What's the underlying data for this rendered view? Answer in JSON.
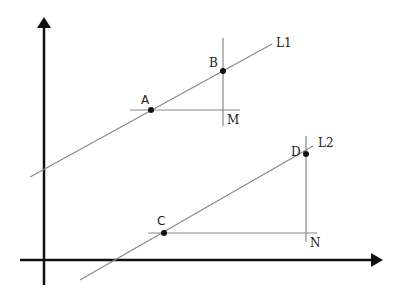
{
  "diagram": {
    "axes": {
      "x_axis": {
        "x1": 20,
        "y1": 260,
        "x2": 374,
        "y2": 260,
        "arrow_tip": [
          383,
          260
        ]
      },
      "y_axis": {
        "x1": 44,
        "y1": 285,
        "x2": 44,
        "y2": 26,
        "arrow_tip": [
          44,
          17
        ]
      }
    },
    "lines": [
      {
        "id": "L1",
        "label": "L1",
        "x1": 30,
        "y1": 177,
        "x2": 272,
        "y2": 44,
        "label_pos": [
          276,
          47
        ]
      },
      {
        "id": "L2",
        "label": "L2",
        "x1": 80,
        "y1": 280,
        "x2": 313,
        "y2": 146,
        "label_pos": [
          318,
          147
        ]
      }
    ],
    "points": [
      {
        "id": "A",
        "label": "A",
        "x": 151,
        "y": 110,
        "label_pos": [
          141,
          104
        ]
      },
      {
        "id": "B",
        "label": "B",
        "x": 223,
        "y": 71,
        "label_pos": [
          209,
          67
        ]
      },
      {
        "id": "C",
        "label": "C",
        "x": 164,
        "y": 233,
        "label_pos": [
          157,
          225
        ]
      },
      {
        "id": "D",
        "label": "D",
        "x": 306,
        "y": 154,
        "label_pos": [
          291,
          155
        ]
      }
    ],
    "construction_lines": [
      {
        "name": "horizontal-through-A",
        "x1": 130,
        "y1": 110,
        "x2": 240,
        "y2": 110
      },
      {
        "name": "vertical-through-B",
        "x1": 223,
        "y1": 38,
        "x2": 223,
        "y2": 126
      },
      {
        "name": "horizontal-through-C",
        "x1": 148,
        "y1": 233,
        "x2": 317,
        "y2": 233
      },
      {
        "name": "vertical-through-D",
        "x1": 306,
        "y1": 136,
        "x2": 306,
        "y2": 242
      }
    ],
    "corner_labels": [
      {
        "id": "M",
        "label": "M",
        "x": 227,
        "y": 124
      },
      {
        "id": "N",
        "label": "N",
        "x": 310,
        "y": 247
      }
    ],
    "colors": {
      "axis": "#111111",
      "line": "#888888",
      "point": "#111111",
      "text": "#222222"
    }
  }
}
